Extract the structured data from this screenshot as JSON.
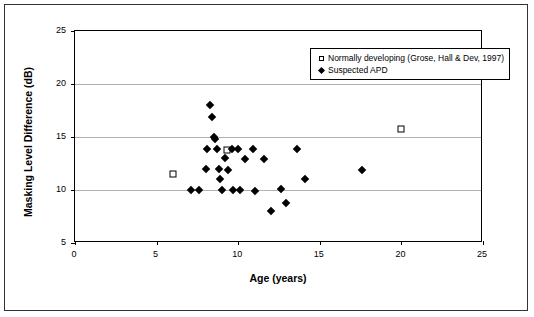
{
  "chart_data": {
    "type": "scatter",
    "title": "",
    "xlabel": "Age (years)",
    "ylabel": "Masking Level Difference (dB)",
    "xlim": [
      0,
      25
    ],
    "ylim": [
      5,
      25
    ],
    "xticks": [
      0,
      5,
      10,
      15,
      20,
      25
    ],
    "yticks": [
      5,
      10,
      15,
      20,
      25
    ],
    "grid": "horizontal",
    "legend_position": "top-right-inside",
    "series": [
      {
        "name": "Normally developing (Grose, Hall & Dev, 1997)",
        "marker": "open-square",
        "color": "#000000",
        "points": [
          [
            6.0,
            11.5
          ],
          [
            9.3,
            13.8
          ],
          [
            20.0,
            15.8
          ]
        ]
      },
      {
        "name": "Suspected APD",
        "marker": "filled-diamond",
        "color": "#000000",
        "points": [
          [
            7.1,
            10.0
          ],
          [
            7.6,
            10.0
          ],
          [
            8.0,
            12.0
          ],
          [
            8.1,
            13.9
          ],
          [
            8.3,
            18.0
          ],
          [
            8.4,
            16.9
          ],
          [
            8.5,
            15.0
          ],
          [
            8.6,
            14.8
          ],
          [
            8.7,
            13.9
          ],
          [
            8.8,
            12.0
          ],
          [
            8.9,
            11.0
          ],
          [
            9.0,
            10.0
          ],
          [
            9.2,
            13.0
          ],
          [
            9.4,
            11.9
          ],
          [
            9.6,
            13.9
          ],
          [
            9.7,
            10.0
          ],
          [
            10.0,
            13.9
          ],
          [
            10.1,
            10.0
          ],
          [
            10.4,
            12.9
          ],
          [
            10.9,
            13.9
          ],
          [
            11.0,
            9.9
          ],
          [
            11.6,
            12.9
          ],
          [
            12.0,
            8.0
          ],
          [
            12.6,
            10.1
          ],
          [
            12.9,
            8.8
          ],
          [
            13.6,
            13.9
          ],
          [
            14.1,
            11.0
          ],
          [
            17.6,
            11.9
          ]
        ]
      }
    ]
  },
  "legend": {
    "items": [
      {
        "marker": "open-square",
        "label": "Normally developing (Grose, Hall & Dev, 1997)"
      },
      {
        "marker": "filled-diamond",
        "label": "Suspected APD"
      }
    ]
  }
}
